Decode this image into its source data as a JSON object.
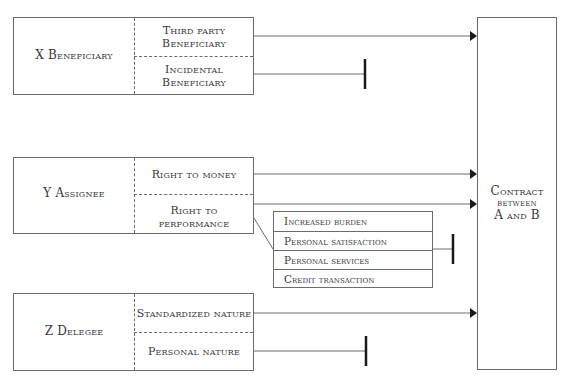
{
  "diagram": {
    "groups": [
      {
        "id": "x",
        "title": "X Beneficiary",
        "items": [
          {
            "label_line1": "Third party",
            "label_line2": "Beneficiary",
            "connection": "arrow"
          },
          {
            "label_line1": "Incidental",
            "label_line2": "Beneficiary",
            "connection": "blocked"
          }
        ]
      },
      {
        "id": "y",
        "title": "Y Assignee",
        "items": [
          {
            "label": "Right to money",
            "connection": "arrow"
          },
          {
            "label": "Right to performance",
            "connection": "arrow"
          }
        ],
        "exceptions": {
          "items": [
            "Increased burden",
            "Personal satisfaction",
            "Personal services",
            "Credit transaction"
          ],
          "connection": "blocked"
        }
      },
      {
        "id": "z",
        "title": "Z Delegee",
        "items": [
          {
            "label": "Standardized nature",
            "connection": "arrow"
          },
          {
            "label": "Personal nature",
            "connection": "blocked"
          }
        ]
      }
    ],
    "target": {
      "line1": "Contract",
      "line2": "between",
      "line3": "A and B"
    },
    "colors": {
      "line": "#6b6b6b",
      "arrow": "#1a1a1a",
      "text": "#3a3a3a"
    }
  }
}
